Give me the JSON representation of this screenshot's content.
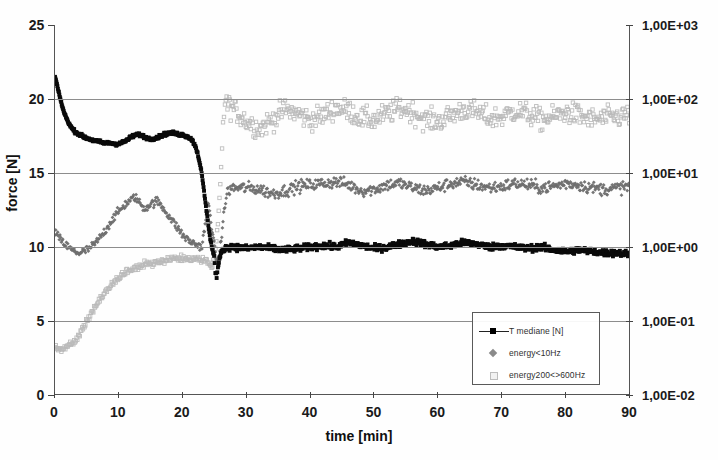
{
  "chart_data": {
    "type": "scatter",
    "title": "",
    "xlabel": "time [min]",
    "ylabel": "force [N]",
    "xlim": [
      0,
      90
    ],
    "ylim": [
      0,
      25
    ],
    "xticks": [
      "0",
      "10",
      "20",
      "30",
      "40",
      "50",
      "60",
      "70",
      "80",
      "90"
    ],
    "yticks_left": [
      "0",
      "5",
      "10",
      "15",
      "20",
      "25"
    ],
    "y2label": "",
    "y2_scale": "log",
    "y2lim": [
      "1,00E-02",
      "1,00E+03"
    ],
    "yticks_right": [
      "1,00E+03",
      "1,00E+02",
      "1,00E+01",
      "1,00E+00",
      "1,00E-01",
      "1,00E-02"
    ],
    "grid": "horizontal",
    "legend_position": "lower-right-inside",
    "series": [
      {
        "name": "T mediane [N]",
        "marker": "square",
        "color": "#000000",
        "axis": "left",
        "description": "Starts 21.5 N at t=0, drops steeply to ~17 by t=4, flat plateau ~17-17.8 until t=22, then steep fall to ~8 at t=25, recovers to ~10 and stays 9.5-10.5 through t=90"
      },
      {
        "name": "energy<10Hz",
        "marker": "diamond",
        "color": "#6e6e6e",
        "axis": "right",
        "description": "Starts ~11 at t=0, dips to ~9.5 at t=4, rises to ~13.5 peak near t=12, falls to ~10 by t=22, drops to ~8.5 at t=25, jumps to band ~13.5-14.5 for t=27-90"
      },
      {
        "name": "energy200<>600Hz",
        "marker": "square-open",
        "color": "#b4b4b4",
        "axis": "right",
        "description": "Starts ~3.2 at t=0, rises steadily to ~9 by t=20, dips at t=24, jumps to band ~18-20 for t=26-90"
      }
    ],
    "points": {
      "black": [
        [
          0,
          21.5
        ],
        [
          0.3,
          21.0
        ],
        [
          0.6,
          20.4
        ],
        [
          0.9,
          19.9
        ],
        [
          1.2,
          19.4
        ],
        [
          1.5,
          19.0
        ],
        [
          1.8,
          18.7
        ],
        [
          2.1,
          18.4
        ],
        [
          2.4,
          18.2
        ],
        [
          2.7,
          18.0
        ],
        [
          3.0,
          17.85
        ],
        [
          3.5,
          17.7
        ],
        [
          4.0,
          17.55
        ],
        [
          4.5,
          17.45
        ],
        [
          5.0,
          17.35
        ],
        [
          5.5,
          17.28
        ],
        [
          6.0,
          17.2
        ],
        [
          6.5,
          17.15
        ],
        [
          7.0,
          17.1
        ],
        [
          7.5,
          17.05
        ],
        [
          8.0,
          17.0
        ],
        [
          8.5,
          17.05
        ],
        [
          9.0,
          17.0
        ],
        [
          9.5,
          16.95
        ],
        [
          10.0,
          17.0
        ],
        [
          10.5,
          17.05
        ],
        [
          11.0,
          17.15
        ],
        [
          11.5,
          17.3
        ],
        [
          12.0,
          17.45
        ],
        [
          12.5,
          17.55
        ],
        [
          13.0,
          17.6
        ],
        [
          13.5,
          17.55
        ],
        [
          14.0,
          17.45
        ],
        [
          14.5,
          17.35
        ],
        [
          15.0,
          17.3
        ],
        [
          15.5,
          17.35
        ],
        [
          16.0,
          17.4
        ],
        [
          16.5,
          17.5
        ],
        [
          17.0,
          17.6
        ],
        [
          17.5,
          17.65
        ],
        [
          18.0,
          17.7
        ],
        [
          18.5,
          17.7
        ],
        [
          19.0,
          17.65
        ],
        [
          19.5,
          17.6
        ],
        [
          20.0,
          17.6
        ],
        [
          20.5,
          17.5
        ],
        [
          21.0,
          17.4
        ],
        [
          21.5,
          17.2
        ],
        [
          22.0,
          16.8
        ],
        [
          22.4,
          16.2
        ],
        [
          22.8,
          15.4
        ],
        [
          23.1,
          14.5
        ],
        [
          23.4,
          13.5
        ],
        [
          23.7,
          12.5
        ],
        [
          24.0,
          11.5
        ],
        [
          24.3,
          10.6
        ],
        [
          24.6,
          9.9
        ],
        [
          24.9,
          9.4
        ],
        [
          25.1,
          8.3
        ],
        [
          25.3,
          8.0
        ],
        [
          25.5,
          8.6
        ],
        [
          25.8,
          9.3
        ],
        [
          26.1,
          9.7
        ],
        [
          26.5,
          9.9
        ],
        [
          27,
          10.0
        ],
        [
          28,
          10.0
        ],
        [
          30,
          9.9
        ],
        [
          32,
          10.0
        ],
        [
          34,
          9.9
        ],
        [
          36,
          9.8
        ],
        [
          38,
          9.9
        ],
        [
          40,
          10.0
        ],
        [
          42,
          10.1
        ],
        [
          44,
          10.0
        ],
        [
          46,
          10.3
        ],
        [
          48,
          10.1
        ],
        [
          50,
          9.9
        ],
        [
          52,
          10.0
        ],
        [
          54,
          10.2
        ],
        [
          56,
          10.4
        ],
        [
          58,
          10.2
        ],
        [
          60,
          10.0
        ],
        [
          62,
          10.1
        ],
        [
          64,
          10.3
        ],
        [
          66,
          10.2
        ],
        [
          68,
          10.0
        ],
        [
          70,
          10.1
        ],
        [
          72,
          10.0
        ],
        [
          74,
          9.9
        ],
        [
          76,
          10.0
        ],
        [
          78,
          9.8
        ],
        [
          80,
          9.7
        ],
        [
          82,
          9.8
        ],
        [
          84,
          9.7
        ],
        [
          86,
          9.6
        ],
        [
          88,
          9.6
        ],
        [
          90,
          9.5
        ]
      ],
      "midgray": [
        [
          0,
          11.0
        ],
        [
          1,
          10.4
        ],
        [
          2,
          10.0
        ],
        [
          3,
          9.7
        ],
        [
          4,
          9.6
        ],
        [
          5,
          9.8
        ],
        [
          6,
          10.1
        ],
        [
          7,
          10.6
        ],
        [
          8,
          11.2
        ],
        [
          9,
          11.9
        ],
        [
          10,
          12.4
        ],
        [
          11,
          12.9
        ],
        [
          12,
          13.2
        ],
        [
          12.5,
          13.4
        ],
        [
          13,
          13.1
        ],
        [
          14,
          12.6
        ],
        [
          15,
          12.9
        ],
        [
          16,
          13.1
        ],
        [
          17,
          12.6
        ],
        [
          18,
          12.0
        ],
        [
          19,
          11.4
        ],
        [
          20,
          10.8
        ],
        [
          21,
          10.4
        ],
        [
          22,
          10.2
        ],
        [
          23,
          10.0
        ],
        [
          23.5,
          11.5
        ],
        [
          24,
          13.0
        ],
        [
          24.5,
          11.5
        ],
        [
          25,
          9.8
        ],
        [
          25.5,
          8.7
        ],
        [
          26,
          10.5
        ],
        [
          26.5,
          12.5
        ],
        [
          27,
          13.8
        ],
        [
          28,
          14.0
        ],
        [
          30,
          14.0
        ],
        [
          32,
          13.9
        ],
        [
          34,
          13.6
        ],
        [
          36,
          13.8
        ],
        [
          38,
          14.1
        ],
        [
          40,
          14.2
        ],
        [
          42,
          14.3
        ],
        [
          44,
          14.4
        ],
        [
          46,
          14.2
        ],
        [
          48,
          13.8
        ],
        [
          50,
          13.9
        ],
        [
          52,
          14.2
        ],
        [
          54,
          14.3
        ],
        [
          56,
          14.0
        ],
        [
          58,
          13.8
        ],
        [
          60,
          14.0
        ],
        [
          62,
          14.3
        ],
        [
          64,
          14.4
        ],
        [
          66,
          14.2
        ],
        [
          68,
          14.0
        ],
        [
          70,
          14.1
        ],
        [
          72,
          14.3
        ],
        [
          74,
          14.2
        ],
        [
          76,
          14.0
        ],
        [
          78,
          14.1
        ],
        [
          80,
          14.3
        ],
        [
          82,
          14.2
        ],
        [
          84,
          14.0
        ],
        [
          86,
          13.9
        ],
        [
          88,
          14.0
        ],
        [
          90,
          14.1
        ]
      ],
      "lightgray": [
        [
          0,
          3.2
        ],
        [
          1,
          3.1
        ],
        [
          2,
          3.3
        ],
        [
          3,
          3.6
        ],
        [
          4,
          4.2
        ],
        [
          5,
          5.0
        ],
        [
          6,
          5.8
        ],
        [
          7,
          6.4
        ],
        [
          8,
          7.0
        ],
        [
          9,
          7.5
        ],
        [
          10,
          7.9
        ],
        [
          11,
          8.2
        ],
        [
          12,
          8.5
        ],
        [
          13,
          8.7
        ],
        [
          14,
          8.8
        ],
        [
          15,
          8.9
        ],
        [
          16,
          9.0
        ],
        [
          17,
          9.1
        ],
        [
          18,
          9.2
        ],
        [
          19,
          9.2
        ],
        [
          20,
          9.2
        ],
        [
          21,
          9.2
        ],
        [
          22,
          9.2
        ],
        [
          23,
          9.1
        ],
        [
          24,
          9.0
        ],
        [
          24.5,
          8.6
        ],
        [
          25,
          9.2
        ],
        [
          25.5,
          11.5
        ],
        [
          26,
          15.0
        ],
        [
          26.3,
          18.5
        ],
        [
          26.6,
          19.8
        ],
        [
          27,
          19.6
        ],
        [
          28,
          19.3
        ],
        [
          30,
          18.5
        ],
        [
          32,
          18.0
        ],
        [
          34,
          18.6
        ],
        [
          36,
          19.3
        ],
        [
          38,
          19.0
        ],
        [
          40,
          18.6
        ],
        [
          42,
          18.9
        ],
        [
          44,
          19.4
        ],
        [
          46,
          19.2
        ],
        [
          48,
          18.7
        ],
        [
          50,
          18.6
        ],
        [
          52,
          19.0
        ],
        [
          54,
          19.4
        ],
        [
          56,
          19.1
        ],
        [
          58,
          18.6
        ],
        [
          60,
          18.5
        ],
        [
          62,
          18.9
        ],
        [
          64,
          19.3
        ],
        [
          66,
          19.1
        ],
        [
          68,
          18.7
        ],
        [
          70,
          18.8
        ],
        [
          72,
          19.2
        ],
        [
          74,
          19.0
        ],
        [
          76,
          18.6
        ],
        [
          78,
          18.8
        ],
        [
          80,
          19.1
        ],
        [
          82,
          18.9
        ],
        [
          84,
          18.6
        ],
        [
          86,
          18.7
        ],
        [
          88,
          18.8
        ],
        [
          90,
          18.9
        ]
      ]
    },
    "legend_entries": [
      {
        "label": "T mediane [N]"
      },
      {
        "label": "energy<10Hz"
      },
      {
        "label": "energy200<>600Hz"
      }
    ]
  }
}
